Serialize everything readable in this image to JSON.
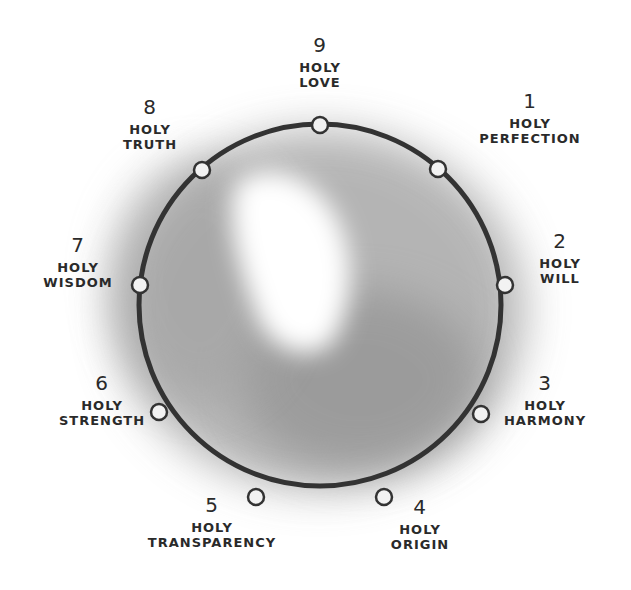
{
  "diagram": {
    "type": "enneagram-circle",
    "colors": {
      "line": "#333333",
      "node_fill": "#f2f2f2",
      "wash": "#9a9a9a",
      "background": "#ffffff"
    },
    "points": [
      {
        "number": "9",
        "line1": "HOLY",
        "line2": "LOVE"
      },
      {
        "number": "1",
        "line1": "HOLY",
        "line2": "PERFECTION"
      },
      {
        "number": "2",
        "line1": "HOLY",
        "line2": "WILL"
      },
      {
        "number": "3",
        "line1": "HOLY",
        "line2": "HARMONY"
      },
      {
        "number": "4",
        "line1": "HOLY",
        "line2": "ORIGIN"
      },
      {
        "number": "5",
        "line1": "HOLY",
        "line2": "TRANSPARENCY"
      },
      {
        "number": "6",
        "line1": "HOLY",
        "line2": "STRENGTH"
      },
      {
        "number": "7",
        "line1": "HOLY",
        "line2": "WISDOM"
      },
      {
        "number": "8",
        "line1": "HOLY",
        "line2": "TRUTH"
      }
    ]
  }
}
